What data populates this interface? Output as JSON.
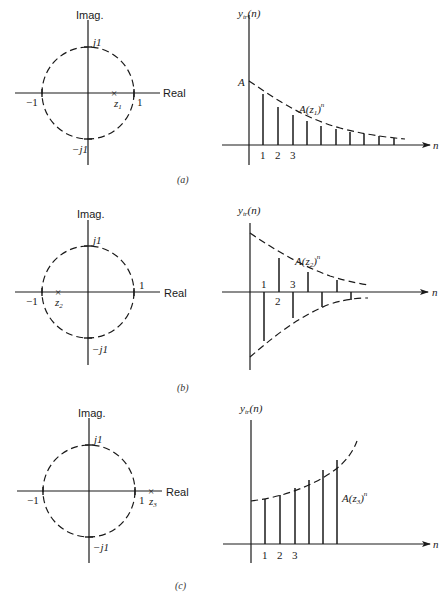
{
  "figure": {
    "panels": [
      {
        "id": "a",
        "caption": "(a)",
        "z_plane": {
          "imag_label": "Imag.",
          "real_label": "Real",
          "j1_label": "j1",
          "neg_j1_label": "−j1",
          "one_label": "1",
          "neg_one_label": "−1",
          "pole_label": "z",
          "pole_sub": "1",
          "pole_marker": "×",
          "pole_position": "inside unit circle, positive real axis"
        },
        "response": {
          "y_label": "y",
          "y_label_sub": "tr",
          "y_label_arg": "(n)",
          "x_label": "n",
          "start_label": "A",
          "envelope_label": "A(z",
          "envelope_sub": "1",
          "envelope_tail": ")",
          "envelope_exp": "n",
          "tick_labels": [
            "1",
            "2",
            "3"
          ],
          "behavior": "decaying, all positive"
        }
      },
      {
        "id": "b",
        "caption": "(b)",
        "z_plane": {
          "imag_label": "Imag.",
          "real_label": "Real",
          "j1_label": "j1",
          "neg_j1_label": "−j1",
          "one_label": "1",
          "neg_one_label": "−1",
          "pole_label": "z",
          "pole_sub": "2",
          "pole_marker": "×",
          "pole_position": "inside unit circle, negative real axis"
        },
        "response": {
          "y_label": "y",
          "y_label_sub": "tr",
          "y_label_arg": "(n)",
          "x_label": "n",
          "envelope_label": "A(z",
          "envelope_sub": "2",
          "envelope_tail": ")",
          "envelope_exp": "n",
          "tick_labels": [
            "1",
            "2",
            "3"
          ],
          "behavior": "decaying, alternating sign"
        }
      },
      {
        "id": "c",
        "caption": "(c)",
        "z_plane": {
          "imag_label": "Imag.",
          "real_label": "Real",
          "j1_label": "j1",
          "neg_j1_label": "−j1",
          "one_label": "1",
          "neg_one_label": "−1",
          "pole_label": "z",
          "pole_sub": "3",
          "pole_marker": "×",
          "pole_position": "outside unit circle, positive real axis"
        },
        "response": {
          "y_label": "y",
          "y_label_sub": "tr",
          "y_label_arg": "(n)",
          "x_label": "n",
          "envelope_label": "A(z",
          "envelope_sub": "3",
          "envelope_tail": ")",
          "envelope_exp": "n",
          "tick_labels": [
            "1",
            "2",
            "3"
          ],
          "behavior": "growing, all positive"
        }
      }
    ]
  }
}
